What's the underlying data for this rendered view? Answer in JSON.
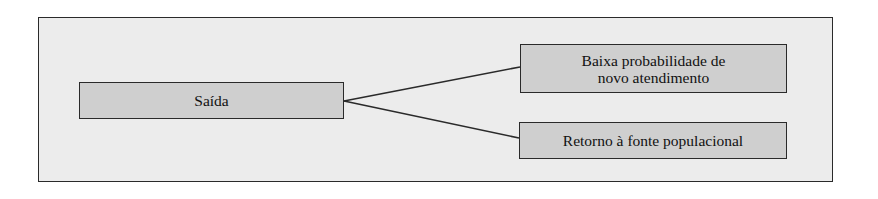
{
  "diagram": {
    "type": "flow-branch",
    "source_node": {
      "label": "Saída"
    },
    "target_nodes": [
      {
        "lines": [
          "Baixa probabilidade de",
          "novo atendimento"
        ]
      },
      {
        "lines": [
          "Retorno à fonte populacional"
        ]
      }
    ],
    "colors": {
      "frame_background": "#ececec",
      "node_background": "#cfcfcf",
      "border": "#2a2a2a",
      "text": "#111111"
    }
  }
}
